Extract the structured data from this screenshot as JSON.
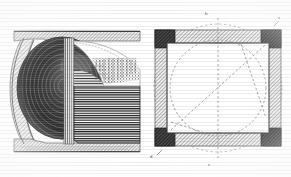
{
  "plate": {
    "medium": "engraving",
    "ink_color": "#2b2b2b",
    "paper_color": "#ffffff",
    "mid_tone": "#9a9a9a",
    "light_tone": "#cfcfcf",
    "dark_tone": "#3c3c3c",
    "dashed_line_color": "#8a8a8a"
  },
  "figures": [
    {
      "id": "figure-left",
      "name": "sectional-elevation",
      "description": "Vertical cross-section showing a hemispherical shaded bowl within a C-shaped hatched casing, with horizontally hatched solid body to the right and a white parabolic void.",
      "parts": {
        "top_band": "upper hatched flange",
        "bottom_band": "lower hatched flange",
        "left_wall": "curved hatched outer wall",
        "bowl": "shaded hemispherical cavity",
        "solid_body": "horizontally hatched mass",
        "void": "white parabolic void",
        "stipple_panel": "fine vertical stipple detail"
      }
    },
    {
      "id": "figure-right",
      "name": "plan-view",
      "description": "Square frame with darkened corner blocks and hatched edge bands, an inscribed circle, two dashed construction circles, dashed diagonals and dashed vertical centreline.",
      "parts": {
        "frame": "square hatched frame",
        "corners": "four dark corner blocks",
        "inscribed_circle": "dashed inscribed circle",
        "outer_circle": "dashed circumscribing circle",
        "diagonals": "dashed diagonal construction lines",
        "centreline": "dashed vertical centreline"
      }
    }
  ],
  "labels": [
    {
      "id": "label-top",
      "text": "b",
      "figure": "figure-right",
      "position": "top-centre"
    },
    {
      "id": "label-top-right",
      "text": "a",
      "figure": "figure-right",
      "position": "top-right"
    },
    {
      "id": "label-bottom",
      "text": "c",
      "figure": "figure-right",
      "position": "bottom-centre"
    },
    {
      "id": "label-bottom-left",
      "text": "d",
      "figure": "figure-right",
      "position": "bottom-left"
    }
  ]
}
